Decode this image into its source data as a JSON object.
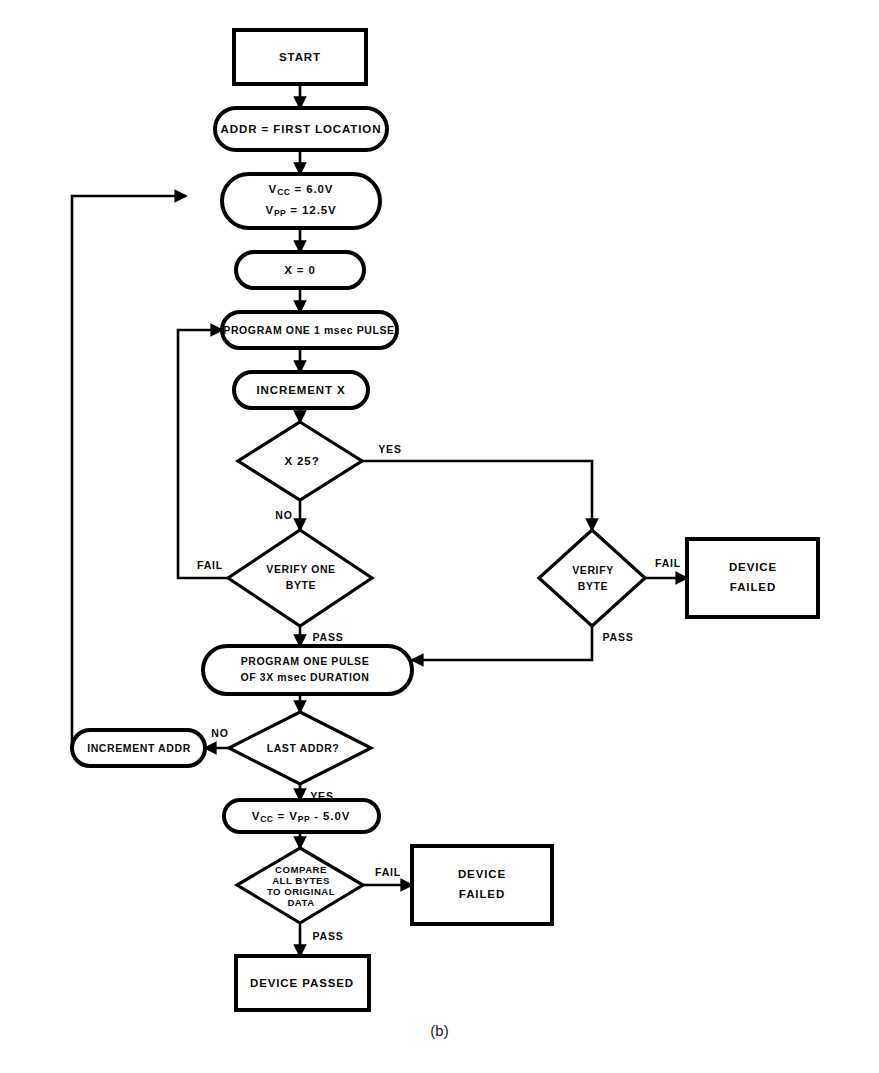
{
  "figure": {
    "caption": "(b)",
    "type": "flowchart"
  },
  "colors": {
    "stroke": "#000000",
    "fill": "#ffffff",
    "background": "#ffffff"
  },
  "nodes": {
    "start": {
      "label": "START",
      "shape": "rectangle"
    },
    "addr_first": {
      "label": "ADDR = FIRST LOCATION",
      "shape": "stadium"
    },
    "set_voltages": {
      "line1_prefix": "V",
      "line1_sub": "CC",
      "line1_rest": " = 6.0V",
      "line2_prefix": "V",
      "line2_sub": "PP",
      "line2_rest": " = 12.5V",
      "shape": "stadium"
    },
    "x_zero": {
      "label": "X = 0",
      "shape": "stadium"
    },
    "program_pulse": {
      "label": "PROGRAM ONE 1 msec PULSE",
      "shape": "stadium"
    },
    "increment_x": {
      "label": "INCREMENT X",
      "shape": "stadium"
    },
    "x_25": {
      "label": "X   25?",
      "shape": "diamond"
    },
    "verify_one_byte": {
      "line1": "VERIFY ONE",
      "line2": "BYTE",
      "shape": "diamond"
    },
    "verify_byte": {
      "line1": "VERIFY",
      "line2": "BYTE",
      "shape": "diamond"
    },
    "device_failed_right": {
      "line1": "DEVICE",
      "line2": "FAILED",
      "shape": "rectangle"
    },
    "program_3x": {
      "line1": "PROGRAM ONE PULSE",
      "line2": "OF 3X msec DURATION",
      "shape": "stadium"
    },
    "last_addr": {
      "label": "LAST ADDR?",
      "shape": "diamond"
    },
    "increment_addr": {
      "label": "INCREMENT ADDR",
      "shape": "stadium"
    },
    "vcc_vpp_minus": {
      "line1_prefix": "V",
      "line1_sub": "CC",
      "line1_mid": " = V",
      "line1_sub2": "PP",
      "line1_rest": " -  5.0V",
      "shape": "stadium"
    },
    "compare_all": {
      "line1": "COMPARE",
      "line2": "ALL BYTES",
      "line3": "TO ORIGINAL",
      "line4": "DATA",
      "shape": "diamond"
    },
    "device_failed_bottom": {
      "line1": "DEVICE",
      "line2": "FAILED",
      "shape": "rectangle"
    },
    "device_passed": {
      "label": "DEVICE PASSED",
      "shape": "rectangle"
    }
  },
  "edges": {
    "x25_yes": "YES",
    "x25_no": "NO",
    "verify_one_byte_fail": "FAIL",
    "verify_one_byte_pass": "PASS",
    "verify_byte_fail": "FAIL",
    "verify_byte_pass": "PASS",
    "last_addr_no": "NO",
    "last_addr_yes": "YES",
    "compare_fail": "FAIL",
    "compare_pass": "PASS"
  }
}
